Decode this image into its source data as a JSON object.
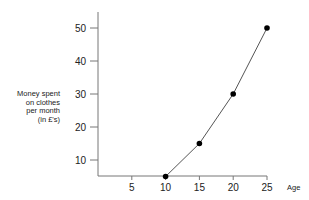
{
  "chart_data": {
    "type": "line",
    "title": "",
    "xlabel": "Age",
    "ylabel": [
      "Money spent",
      "on clothes",
      "per month",
      "(in £'s)"
    ],
    "x_ticks": [
      5,
      10,
      15,
      20,
      25
    ],
    "y_ticks": [
      10,
      20,
      30,
      40,
      50
    ],
    "xlim": [
      0,
      25
    ],
    "ylim": [
      5,
      55
    ],
    "grid": false,
    "legend": null,
    "series": [
      {
        "name": "Money spent on clothes",
        "x": [
          10,
          15,
          20,
          25
        ],
        "y": [
          5,
          15,
          30,
          50
        ],
        "color": "#000000"
      }
    ]
  }
}
